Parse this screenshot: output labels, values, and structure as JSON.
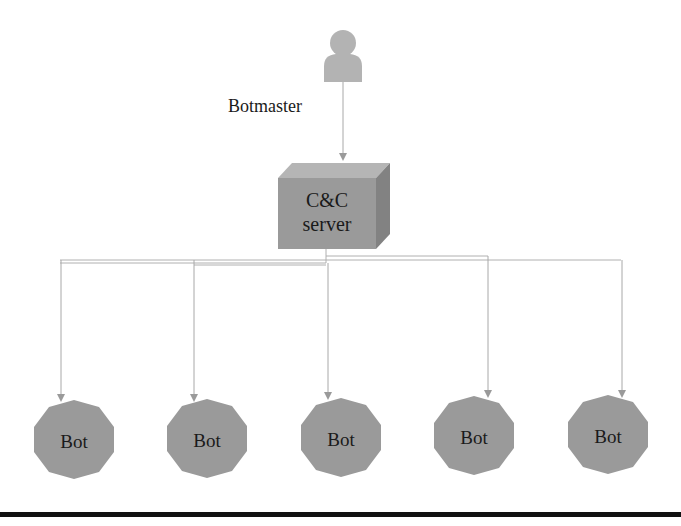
{
  "diagram": {
    "type": "botnet-centralized-topology",
    "botmaster": {
      "label": "Botmaster",
      "icon": "person-icon"
    },
    "server": {
      "line1": "C&C",
      "line2": "server",
      "icon": "3d-box"
    },
    "bots": [
      {
        "label": "Bot"
      },
      {
        "label": "Bot"
      },
      {
        "label": "Bot"
      },
      {
        "label": "Bot"
      },
      {
        "label": "Bot"
      }
    ],
    "edges": [
      {
        "from": "Botmaster",
        "to": "C&C server"
      },
      {
        "from": "C&C server",
        "to": "Bot 1"
      },
      {
        "from": "C&C server",
        "to": "Bot 2"
      },
      {
        "from": "C&C server",
        "to": "Bot 3"
      },
      {
        "from": "C&C server",
        "to": "Bot 4"
      },
      {
        "from": "C&C server",
        "to": "Bot 5"
      }
    ],
    "colors": {
      "shape_fill": "#9a9a9a",
      "box_top": "#b5b5b5",
      "box_side": "#828282",
      "person": "#b3b3b3",
      "connector": "#a8a8a8",
      "text": "#1a1a1a"
    }
  }
}
